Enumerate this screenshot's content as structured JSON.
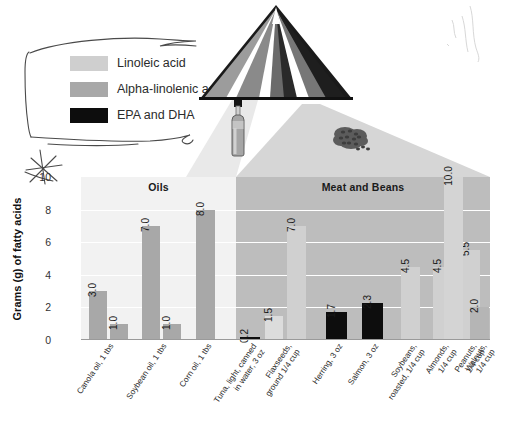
{
  "legend": {
    "items": [
      {
        "label": "Linoleic acid",
        "color": "#cfcfcf",
        "name": "linoleic-acid"
      },
      {
        "label": "Alpha-linolenic acid",
        "color": "#a8a8a8",
        "name": "alpha-linolenic-acid"
      },
      {
        "label": "EPA and DHA",
        "color": "#0d0d0d",
        "name": "epa-and-dha"
      }
    ]
  },
  "graphic": {
    "pyramid_name": "food-guide-pyramid-icon",
    "bottle_name": "oil-bottle-icon",
    "seeds_name": "seeds-cluster-icon",
    "annotation_star": "hand-drawn-star",
    "annotation_bracket": "hand-drawn-bracket-around-legend"
  },
  "chart_data": {
    "type": "bar",
    "title": "",
    "xlabel": "",
    "ylabel": "Grams (g) of fatty acids",
    "ylim": [
      0,
      10
    ],
    "yticks": [
      0,
      2,
      4,
      6,
      8,
      10
    ],
    "grid": true,
    "legend_position": "top-left-outside",
    "panels": [
      {
        "label": "Oils",
        "start_index": 0,
        "end_index": 3,
        "background": "#f2f2f2"
      },
      {
        "label": "Meat and Beans",
        "start_index": 3,
        "end_index": 11,
        "background": "#bdbdbd"
      }
    ],
    "categories": [
      "Canola oil, 1 tbs",
      "Soybean oil, 1 tbs",
      "Corn oil, 1 tbs",
      "Tuna, light, canned\nin water, 3 oz",
      "Flaxseeds,\nground 1/4 cup",
      "Herring, 3 oz",
      "Salmon, 3 oz",
      "Soybeans,\nroasted, 1/4 cup",
      "Almonds, 1/4 cup",
      "Peanuts, 1/4 cup",
      "Walnuts, 1/4 cup"
    ],
    "series": [
      {
        "name": "Linoleic acid",
        "color": "#cfcfcf",
        "values": [
          null,
          7.0,
          8.0,
          null,
          1.5,
          null,
          null,
          4.5,
          4.5,
          5.5,
          10.0
        ]
      },
      {
        "name": "Alpha-linolenic acid",
        "color": "#a8a8a8",
        "values": [
          3.0,
          1.0,
          null,
          null,
          7.0,
          null,
          null,
          null,
          null,
          null,
          2.0
        ]
      },
      {
        "name": "EPA and DHA",
        "color": "#0d0d0d",
        "values": [
          null,
          null,
          null,
          0.2,
          null,
          1.7,
          2.3,
          null,
          null,
          null,
          null
        ]
      }
    ],
    "bars": [
      {
        "category": 0,
        "series": "Alpha-linolenic acid",
        "value": 3.0,
        "label": "3.0",
        "color": "#a8a8a8",
        "x": 8,
        "w": 18
      },
      {
        "category": 0,
        "series": "Linoleic acid",
        "value": 1.0,
        "label": "1.0",
        "color": "#a8a8a8",
        "x": 29,
        "w": 18
      },
      {
        "category": 1,
        "series": "Linoleic acid",
        "value": 7.0,
        "label": "7.0",
        "color": "#a8a8a8",
        "x": 61,
        "w": 18
      },
      {
        "category": 1,
        "series": "Alpha-linolenic acid",
        "value": 1.0,
        "label": "1.0",
        "color": "#a8a8a8",
        "x": 82,
        "w": 18
      },
      {
        "category": 2,
        "series": "Linoleic acid",
        "value": 8.0,
        "label": "8.0",
        "color": "#a8a8a8",
        "x": 115,
        "w": 19
      },
      {
        "category": 3,
        "series": "EPA and DHA",
        "value": 0.2,
        "label": "0.2",
        "color": "#0d0d0d",
        "x": 159,
        "w": 20
      },
      {
        "category": 4,
        "series": "Linoleic acid",
        "value": 1.5,
        "label": "1.5",
        "color": "#dcdcdc",
        "x": 184,
        "w": 18
      },
      {
        "category": 4,
        "series": "Alpha-linolenic acid",
        "value": 7.0,
        "label": "7.0",
        "color": "#d0d0d0",
        "x": 206,
        "w": 19
      },
      {
        "category": 5,
        "series": "EPA and DHA",
        "value": 1.7,
        "label": "1.7",
        "color": "#0d0d0d",
        "x": 245,
        "w": 21
      },
      {
        "category": 6,
        "series": "EPA and DHA",
        "value": 2.3,
        "label": "2.3",
        "color": "#0d0d0d",
        "x": 281,
        "w": 21
      },
      {
        "category": 7,
        "series": "Linoleic acid",
        "value": 4.5,
        "label": "4.5",
        "color": "#d0d0d0",
        "x": 320,
        "w": 19
      },
      {
        "category": 8,
        "series": "Linoleic acid",
        "value": 4.5,
        "label": "4.5",
        "color": "#d0d0d0",
        "x": 352,
        "w": 19
      },
      {
        "category": 9,
        "series": "Linoleic acid",
        "value": 5.5,
        "label": "5.5",
        "color": "#d0d0d0",
        "x": 380,
        "w": 19
      },
      {
        "category": 10,
        "series": "Linoleic acid",
        "value": 10.0,
        "label": "10.0",
        "color": "#d4d4d4",
        "x": 363,
        "w": 19
      },
      {
        "category": 10,
        "series": "Alpha-linolenic acid",
        "value": 2.0,
        "label": "2.0",
        "color": "#b5b5b5",
        "x": 389,
        "w": 19
      }
    ]
  },
  "colors": {
    "panel_oils_bg": "#f2f2f2",
    "panel_meat_bg": "#bdbdbd",
    "gridline": "#ffffff",
    "text": "#222222"
  }
}
